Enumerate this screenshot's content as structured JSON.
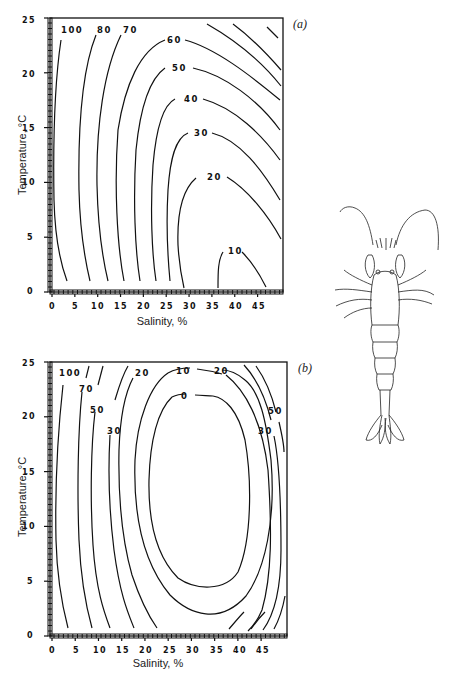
{
  "chart_data": [
    {
      "panel": "(a)",
      "type": "contour",
      "xlabel": "Salinity, %",
      "ylabel": "Temperature, °C",
      "xticks": [
        "0",
        "5",
        "10",
        "15",
        "20",
        "25",
        "30",
        "35",
        "40",
        "45"
      ],
      "yticks": [
        "0",
        "5",
        "10",
        "15",
        "20",
        "25"
      ],
      "xlim": [
        0,
        50
      ],
      "ylim": [
        0,
        25
      ],
      "grid": false,
      "contour_levels": [
        "100",
        "80",
        "70",
        "60",
        "50",
        "40",
        "30",
        "20",
        "10"
      ],
      "contour_labels": [
        {
          "text": "100",
          "x": 4,
          "y": 24
        },
        {
          "text": "80",
          "x": 12,
          "y": 24
        },
        {
          "text": "70",
          "x": 18,
          "y": 24
        },
        {
          "text": "60",
          "x": 26,
          "y": 22.5
        },
        {
          "text": "50",
          "x": 27.5,
          "y": 19.8
        },
        {
          "text": "40",
          "x": 29.5,
          "y": 17.5
        },
        {
          "text": "30",
          "x": 32.5,
          "y": 14.3
        },
        {
          "text": "20",
          "x": 34.5,
          "y": 10.3
        },
        {
          "text": "10",
          "x": 38.5,
          "y": 2.8
        }
      ],
      "note": "Mortality-style response surface; minimum (~10) near salinity 35-45, temperature 0-3 °C"
    },
    {
      "panel": "(b)",
      "type": "contour",
      "xlabel": "Salinity, %",
      "ylabel": "Temperature, °C",
      "xticks": [
        "0",
        "5",
        "10",
        "15",
        "20",
        "25",
        "30",
        "35",
        "40",
        "45"
      ],
      "yticks": [
        "0",
        "5",
        "10",
        "15",
        "20",
        "25"
      ],
      "xlim": [
        0,
        50
      ],
      "ylim": [
        0,
        25
      ],
      "grid": false,
      "contour_levels": [
        "100",
        "70",
        "50",
        "30",
        "20",
        "10",
        "0"
      ],
      "contour_labels": [
        {
          "text": "100",
          "x": 3,
          "y": 24
        },
        {
          "text": "70",
          "x": 8,
          "y": 22.4
        },
        {
          "text": "50",
          "x": 11,
          "y": 20.8
        },
        {
          "text": "30",
          "x": 14,
          "y": 18.8
        },
        {
          "text": "20",
          "x": 22,
          "y": 24
        },
        {
          "text": "10",
          "x": 30.5,
          "y": 24
        },
        {
          "text": "0",
          "x": 31,
          "y": 22
        },
        {
          "text": "20",
          "x": 38.5,
          "y": 24
        },
        {
          "text": "50",
          "x": 46.5,
          "y": 21
        },
        {
          "text": "30",
          "x": 44.5,
          "y": 19
        }
      ],
      "note": "Closed elliptical minimum (0) centered near salinity 32, temperature 13 °C"
    }
  ],
  "figure": {
    "panel_a_label": "(a)",
    "panel_b_label": "(b)",
    "illustration": "shrimp-drawing"
  }
}
